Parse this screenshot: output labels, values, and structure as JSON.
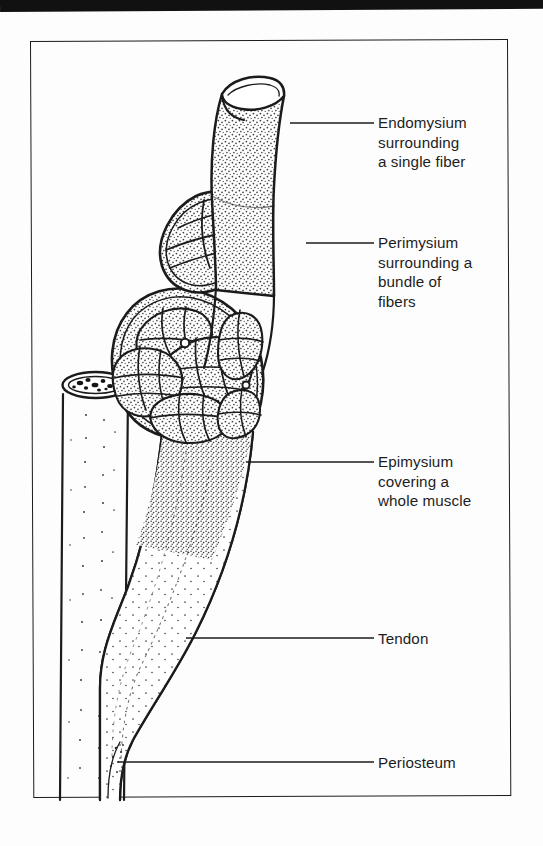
{
  "figure": {
    "kind": "anatomical-line-drawing",
    "frame": {
      "present": true,
      "style": "thin black rectangle"
    },
    "scan_artifact": {
      "top_black_bar": true
    }
  },
  "labels": [
    {
      "id": "endomysium",
      "text": "Endomysium\nsurrounding\na single fiber",
      "leader": {
        "from_x": 290,
        "from_y": 123,
        "to_x": 374,
        "to_y": 123
      },
      "points_to": "single-muscle-fiber"
    },
    {
      "id": "perimysium",
      "text": "Perimysium\nsurrounding a\nbundle of\nfibers",
      "leader": {
        "from_x": 306,
        "from_y": 243,
        "to_x": 374,
        "to_y": 243
      },
      "points_to": "fascicle-bundle"
    },
    {
      "id": "epimysium",
      "text": "Epimysium\ncovering a\nwhole muscle",
      "leader": {
        "from_x": 246,
        "from_y": 462,
        "to_x": 374,
        "to_y": 462
      },
      "points_to": "whole-muscle-belly"
    },
    {
      "id": "tendon",
      "text": "Tendon",
      "leader": {
        "from_x": 186,
        "from_y": 638,
        "to_x": 374,
        "to_y": 638
      },
      "points_to": "tendon"
    },
    {
      "id": "periosteum",
      "text": "Periosteum",
      "leader": {
        "from_x": 118,
        "from_y": 762,
        "to_x": 374,
        "to_y": 762
      },
      "points_to": "bone-surface"
    }
  ],
  "structures": [
    {
      "id": "single-muscle-fiber",
      "description": "cut cylindrical single fiber emerging from the bundle"
    },
    {
      "id": "fascicle-bundle",
      "description": "bundle of fibers wrapped by perimysium, shown in cross section"
    },
    {
      "id": "whole-muscle-belly",
      "description": "whole muscle in cross section containing several fascicles"
    },
    {
      "id": "tendon",
      "description": "tapering fibrous cord continuing from the muscle belly"
    },
    {
      "id": "bone",
      "description": "long bone shaft with cut end showing marrow"
    }
  ],
  "colors": {
    "ink": "#1b1b1b",
    "paper": "#fdfdfd",
    "stipple": "#3a3a3a"
  }
}
